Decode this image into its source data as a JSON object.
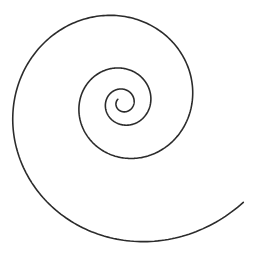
{
  "figure": {
    "type": "logarithmic-spiral",
    "stroke_color": "#2b2b2b",
    "background_color": "#ffffff",
    "turns_visible": 4,
    "growth_factor_per_turn": 2.5,
    "direction_outward": "counter-clockwise",
    "outer_end_position": "bottom-right"
  }
}
